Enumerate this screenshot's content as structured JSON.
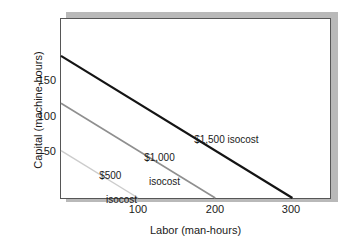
{
  "chart_data": {
    "type": "line",
    "title": "",
    "xlabel": "Labor (man-hours)",
    "ylabel": "Capital (machine-hours)",
    "xlim": [
      0,
      350
    ],
    "ylim": [
      0,
      190
    ],
    "xticks": [
      100,
      200,
      300
    ],
    "xtick_labels": [
      "100",
      "200",
      "300"
    ],
    "yticks": [
      50,
      100,
      150
    ],
    "ytick_labels": [
      "50",
      "100",
      "150"
    ],
    "grid": false,
    "legend": "inline-annotations",
    "series": [
      {
        "name": "$1,500 isocost",
        "label": "$1,500 isocost",
        "label_lines": [
          "$1,500 isocost"
        ],
        "color": "#141414",
        "width": 2.2,
        "x": [
          0,
          300
        ],
        "y": [
          150,
          0
        ]
      },
      {
        "name": "$1,000 isocost",
        "label": "$1,000 isocost",
        "label_lines": [
          "$1,000",
          "isocost"
        ],
        "color": "#8f8f8f",
        "width": 1.6,
        "x": [
          0,
          200
        ],
        "y": [
          100,
          0
        ]
      },
      {
        "name": "$500 isocost",
        "label": "$500 isocost",
        "label_lines": [
          "$500",
          "isocost"
        ],
        "color": "#cccccc",
        "width": 1.4,
        "x": [
          0,
          100
        ],
        "y": [
          50,
          0
        ]
      }
    ],
    "annotations": [
      {
        "text": "$1,500 isocost",
        "x": 160,
        "y": 70
      },
      {
        "text": "$1,000 isocost",
        "x": 95,
        "y": 48
      },
      {
        "text": "$500 isocost",
        "x": 38,
        "y": 28
      }
    ]
  },
  "axes": {
    "y_title": "Capital (machine-hours)",
    "x_title": "Labor (man-hours)",
    "y_tick_150": "150",
    "y_tick_100": "100",
    "y_tick_50": "50",
    "x_tick_100": "100",
    "x_tick_200": "200",
    "x_tick_300": "300"
  },
  "labels": {
    "isocost_1500": "$1,500 isocost",
    "isocost_1000_line1": "$1,000",
    "isocost_1000_line2": "isocost",
    "isocost_500_line1": "$500",
    "isocost_500_line2": "isocost"
  },
  "colors": {
    "line_1500": "#141414",
    "line_1000": "#8f8f8f",
    "line_500": "#cccccc",
    "frame": "#565656",
    "shadow": "#b9b9b9",
    "background": "#ffffff"
  }
}
